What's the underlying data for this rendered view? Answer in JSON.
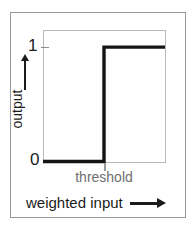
{
  "figure": {
    "kind": "step-function-plot",
    "axes": {
      "y_label": "output",
      "y_arrow_icon": "up-arrow-icon",
      "y_ticks": [
        {
          "label": "1",
          "value": 1
        },
        {
          "label": "0",
          "value": 0
        }
      ],
      "x_label": "weighted input",
      "x_arrow_icon": "right-arrow-icon",
      "x_ticks": [
        {
          "label": "threshold",
          "value": 0
        }
      ]
    },
    "colors": {
      "curve": "#141414",
      "plot_frame": "#b9b9b9",
      "outer_frame": "#9a9a9a",
      "tick_gray": "#9a9a9a",
      "threshold_label": "#6e6e6e",
      "text": "#1b1b1b",
      "background": "#ffffff"
    }
  },
  "chart_data": {
    "type": "line",
    "title": "",
    "xlabel": "weighted input",
    "ylabel": "output",
    "xlim": [
      -1,
      1
    ],
    "ylim": [
      0,
      1.15
    ],
    "grid": false,
    "legend": null,
    "xticks": [
      {
        "value": 0,
        "label": "threshold"
      }
    ],
    "yticks": [
      {
        "value": 0,
        "label": "0"
      },
      {
        "value": 1,
        "label": "1"
      }
    ],
    "series": [
      {
        "name": "step function",
        "color": "#141414",
        "linewidth": 3,
        "x": [
          -1,
          0,
          0,
          1
        ],
        "values": [
          0,
          0,
          1,
          1
        ]
      }
    ],
    "annotations": [
      {
        "text": "threshold",
        "x": 0,
        "y": 0,
        "placement": "below-axis"
      }
    ]
  }
}
